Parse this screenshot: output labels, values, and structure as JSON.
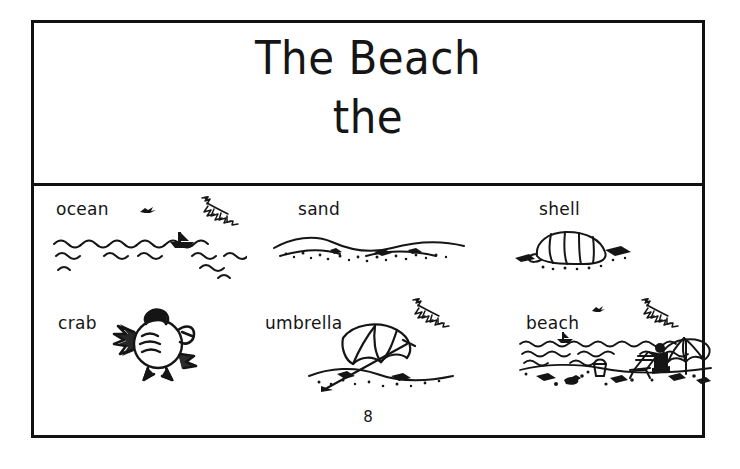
{
  "page": {
    "title_main": "The Beach",
    "title_sub": "the",
    "page_number": "8",
    "ink_color": "#151515",
    "background_color": "#ffffff"
  },
  "vocabulary": {
    "rows": [
      {
        "items": [
          {
            "label": "ocean",
            "art": "ocean-waves-sailboat-illustration"
          },
          {
            "label": "sand",
            "art": "sand-dune-illustration"
          },
          {
            "label": "shell",
            "art": "conch-shell-illustration"
          }
        ]
      },
      {
        "items": [
          {
            "label": "crab",
            "art": "crab-illustration"
          },
          {
            "label": "umbrella",
            "art": "beach-umbrella-illustration"
          },
          {
            "label": "beach",
            "art": "beach-scene-illustration"
          }
        ]
      }
    ]
  },
  "decorations": [
    {
      "name": "bird-silhouette-icon"
    },
    {
      "name": "palm-frond-icon"
    }
  ]
}
